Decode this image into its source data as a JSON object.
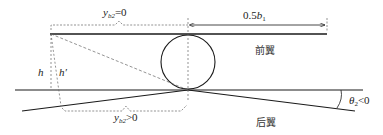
{
  "labels": {
    "top_brace": "y",
    "top_brace_sub": "b2",
    "top_brace_cond": "=0",
    "front_span_prefix": "0.5",
    "front_span_var": "b",
    "front_span_sub": "1",
    "front_wing": "前翼",
    "rear_wing": "后翼",
    "h": "h",
    "h_prime": "h′",
    "bottom_brace": "y",
    "bottom_brace_sub": "b2",
    "bottom_brace_cond": ">0",
    "theta": "θ",
    "theta_sub": "2",
    "theta_cond": "<0"
  },
  "colors": {
    "line": "#1a1a1a",
    "dashed": "#666666",
    "background": "#ffffff"
  }
}
